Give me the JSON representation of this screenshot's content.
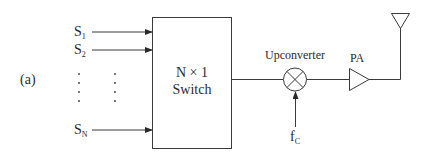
{
  "figure_label": "(a)",
  "inputs": [
    {
      "base": "S",
      "sub": "1"
    },
    {
      "base": "S",
      "sub": "2"
    },
    {
      "base": "S",
      "sub": "N"
    }
  ],
  "ellipsis": "⋮",
  "switch": {
    "line1": "N × 1",
    "line2": "Switch"
  },
  "upconverter": {
    "label": "Upconverter"
  },
  "carrier": {
    "base": "f",
    "sub": "C"
  },
  "amplifier": {
    "label": "PA"
  },
  "antenna": {
    "label": ""
  },
  "colors": {
    "stroke": "#3a3a3a",
    "text": "#2a2a2a",
    "background": "#ffffff"
  }
}
